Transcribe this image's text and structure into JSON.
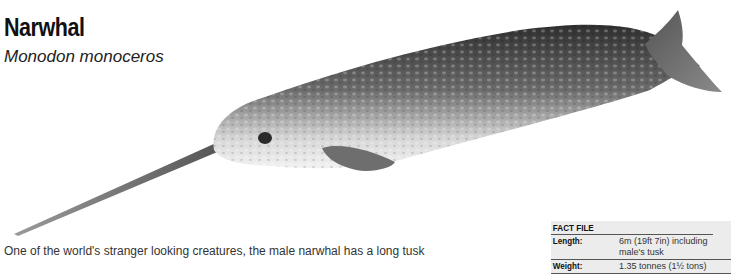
{
  "header": {
    "title": "Narwhal",
    "scientific_name": "Monodon monoceros"
  },
  "illustration": {
    "subject": "narwhal-illustration",
    "colors": {
      "dark": "#3a3a3a",
      "mid": "#7a7a7a",
      "light": "#e8e8e8",
      "tusk": "#8a8a8a"
    }
  },
  "body_text": {
    "intro": "One of the world's stranger looking creatures, the male narwhal has a long tusk"
  },
  "fact_file": {
    "heading": "FACT FILE",
    "rows": [
      {
        "label": "Length:",
        "value": "6m (19ft 7in) including male's tusk"
      },
      {
        "label": "Weight:",
        "value": "1.35 tonnes (1½ tons)"
      }
    ]
  }
}
